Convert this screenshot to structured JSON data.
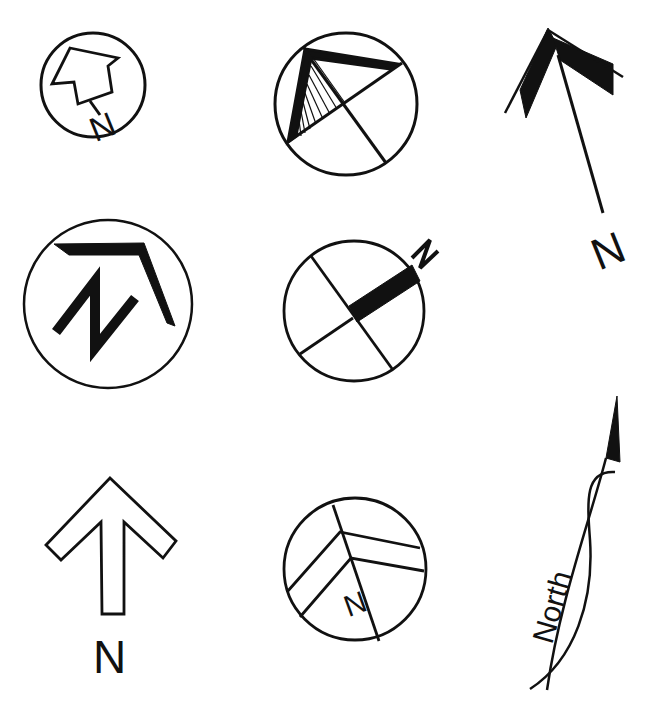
{
  "colors": {
    "ink": "#111111",
    "background": "#ffffff"
  },
  "symbols": [
    {
      "id": "circle-house-arrow",
      "label": "N",
      "description": "Small circle with outlined house-shaped arrow pointing up-right, N below"
    },
    {
      "id": "circle-hatched-triangle",
      "label": "",
      "description": "Circle with quadrant lines and hatched triangular pointer"
    },
    {
      "id": "double-chevron-needle",
      "label": "N",
      "description": "Solid double chevron arrow with long needle and N at tail"
    },
    {
      "id": "circle-large-N-bracket",
      "label": "N",
      "description": "Large circle with bold N and angled bracket pointer"
    },
    {
      "id": "circle-cross-bar",
      "label": "N",
      "description": "Circle with cross and solid bar to upper-right, N outside"
    },
    {
      "id": "outline-up-arrow",
      "label": "N",
      "description": "Outlined upward arrow with N beneath"
    },
    {
      "id": "circle-chevron-lines",
      "label": "N",
      "description": "Circle with chevron stripes and small N"
    },
    {
      "id": "north-curve-needle",
      "label": "North",
      "description": "Curved crossing lines with solid pennant tip and the word North"
    }
  ]
}
